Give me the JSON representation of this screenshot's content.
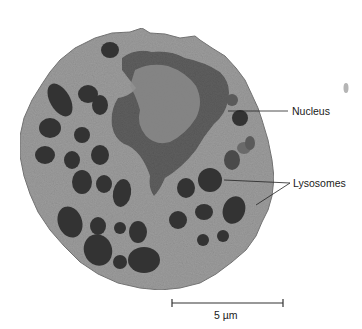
{
  "figure": {
    "type": "electron-micrograph",
    "background_color": "#ffffff",
    "cytoplasm_color": "#9a9a9a",
    "nucleus_color": "#4a4a4a",
    "lysosome_color": "#333333"
  },
  "labels": {
    "nucleus": "Nucleus",
    "lysosomes": "Lysosomes"
  },
  "scale_bar": {
    "label": "5 µm",
    "length_px": 111
  }
}
